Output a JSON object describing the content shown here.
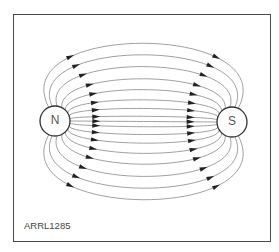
{
  "diagram": {
    "poles": [
      {
        "label": "N",
        "cx": 55,
        "cy": 121,
        "r": 15
      },
      {
        "label": "S",
        "cx": 232,
        "cy": 122,
        "r": 15
      }
    ],
    "caption": "ARRL1285",
    "colors": {
      "line": "#777777",
      "frame": "#4a4a4a",
      "pole_stroke": "#333333"
    },
    "field_line_offsets": [
      -95,
      -80,
      -65,
      -50,
      -37,
      -25,
      -15,
      -6,
      0,
      6,
      15,
      25,
      37,
      50,
      65,
      80,
      95
    ],
    "arrow_direction": "N to S"
  }
}
